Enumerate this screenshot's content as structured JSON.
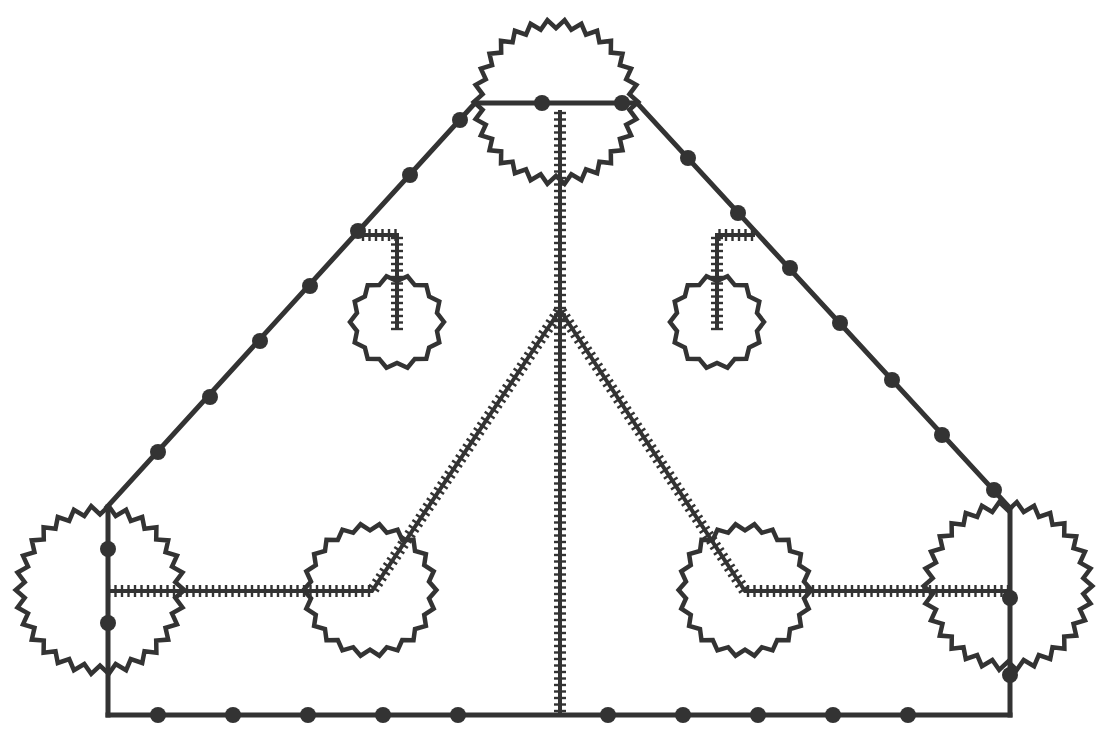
{
  "diagram": {
    "type": "schematic-graph",
    "canvas": {
      "width": 1115,
      "height": 753,
      "background": "#ffffff"
    },
    "colors": {
      "stroke": "#333333"
    },
    "gears": [
      {
        "id": "top-gear",
        "cx": 556,
        "cy": 102,
        "r": 78,
        "teeth": 30
      },
      {
        "id": "bottom-left-gear",
        "cx": 100,
        "cy": 590,
        "r": 80,
        "teeth": 30
      },
      {
        "id": "bottom-right-gear",
        "cx": 1008,
        "cy": 586,
        "r": 80,
        "teeth": 30
      },
      {
        "id": "mid-left-gear",
        "cx": 370,
        "cy": 590,
        "r": 63,
        "teeth": 22
      },
      {
        "id": "mid-right-gear",
        "cx": 745,
        "cy": 590,
        "r": 63,
        "teeth": 22
      },
      {
        "id": "small-left-gear",
        "cx": 397,
        "cy": 322,
        "r": 44,
        "teeth": 14
      },
      {
        "id": "small-right-gear",
        "cx": 717,
        "cy": 322,
        "r": 44,
        "teeth": 14
      }
    ],
    "solid_paths": [
      {
        "id": "top-bar",
        "points": [
          [
            475,
            103
          ],
          [
            637,
            103
          ]
        ]
      },
      {
        "id": "left-diagonal",
        "points": [
          [
            475,
            103
          ],
          [
            107,
            507
          ]
        ]
      },
      {
        "id": "right-diagonal",
        "points": [
          [
            637,
            103
          ],
          [
            1010,
            508
          ]
        ]
      },
      {
        "id": "left-vertical",
        "points": [
          [
            108,
            507
          ],
          [
            108,
            715
          ]
        ]
      },
      {
        "id": "right-vertical",
        "points": [
          [
            1010,
            508
          ],
          [
            1010,
            715
          ]
        ]
      },
      {
        "id": "bottom-bar",
        "points": [
          [
            108,
            715
          ],
          [
            1010,
            715
          ]
        ]
      }
    ],
    "ladder_paths": [
      {
        "id": "center-spine",
        "points": [
          [
            560,
            110
          ],
          [
            560,
            715
          ]
        ]
      },
      {
        "id": "left-branch",
        "points": [
          [
            560,
            310
          ],
          [
            372,
            591
          ],
          [
            108,
            591
          ]
        ]
      },
      {
        "id": "right-branch",
        "points": [
          [
            560,
            310
          ],
          [
            745,
            591
          ],
          [
            1010,
            591
          ]
        ]
      },
      {
        "id": "left-hook",
        "points": [
          [
            360,
            235
          ],
          [
            397,
            235
          ],
          [
            397,
            330
          ]
        ]
      },
      {
        "id": "right-hook",
        "points": [
          [
            755,
            235
          ],
          [
            717,
            235
          ],
          [
            717,
            330
          ]
        ]
      }
    ],
    "nodes": [
      [
        542,
        103
      ],
      [
        622,
        103
      ],
      [
        460,
        120
      ],
      [
        410,
        175
      ],
      [
        358,
        231
      ],
      [
        310,
        286
      ],
      [
        260,
        341
      ],
      [
        210,
        397
      ],
      [
        158,
        452
      ],
      [
        688,
        158
      ],
      [
        738,
        213
      ],
      [
        790,
        268
      ],
      [
        840,
        323
      ],
      [
        892,
        380
      ],
      [
        942,
        435
      ],
      [
        994,
        490
      ],
      [
        108,
        549
      ],
      [
        108,
        623
      ],
      [
        1010,
        598
      ],
      [
        1010,
        675
      ],
      [
        158,
        715
      ],
      [
        233,
        715
      ],
      [
        308,
        715
      ],
      [
        383,
        715
      ],
      [
        458,
        715
      ],
      [
        608,
        715
      ],
      [
        683,
        715
      ],
      [
        758,
        715
      ],
      [
        833,
        715
      ],
      [
        908,
        715
      ]
    ]
  }
}
